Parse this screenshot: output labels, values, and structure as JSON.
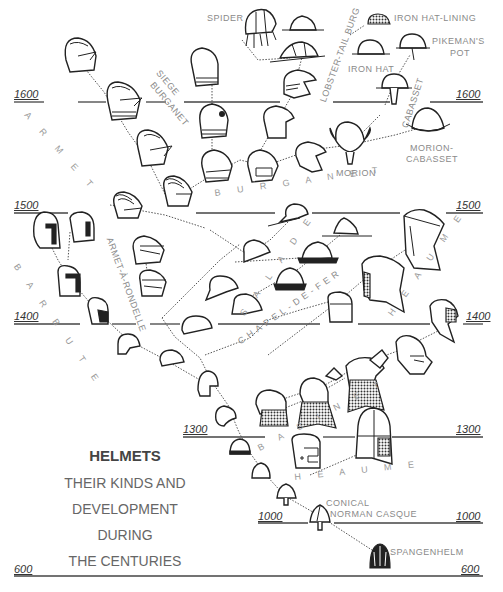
{
  "title": {
    "main": "HELMETS",
    "line1": "THEIR KINDS AND",
    "line2": "DEVELOPMENT DURING",
    "line3": "THE CENTURIES"
  },
  "timeline": {
    "left": [
      "1600",
      "1500",
      "1400",
      "1300",
      "1000",
      "600"
    ],
    "right": [
      "1600",
      "1500",
      "1400",
      "1300",
      "1000",
      "600"
    ]
  },
  "lineages": {
    "armet": "A R M E T",
    "barbute": "B A R B U T E",
    "armet_a_rondelle": "ARMET-À-RONDELLE",
    "siege_burganet_1": "SIEGE",
    "siege_burganet_2": "BURGANET",
    "burganet": "B U R G A N E T",
    "lobster_tail_burg": "LOBSTER-TAIL BURG",
    "salade": "S A L A D E",
    "chapel_de_fer": "CHAPEL-DE-FER",
    "heaume_upper": "H E A U M E",
    "bascinet": "B A S I N E T",
    "heaume_lower": "H E A U M E",
    "cabasset": "CABASSET"
  },
  "named_helmets": {
    "spider": "SPIDER",
    "iron_hat_lining": "IRON HAT-LINING",
    "iron_hat": "IRON HAT",
    "pikemans_pot_1": "PIKEMAN'S",
    "pikemans_pot_2": "POT",
    "morion": "MORION",
    "morion_cabasset_1": "MORION-",
    "morion_cabasset_2": "CABASSET",
    "conical_1": "CONICAL",
    "conical_2": "NORMAN CASQUE",
    "spangenhelm": "SPANGENHELM"
  }
}
